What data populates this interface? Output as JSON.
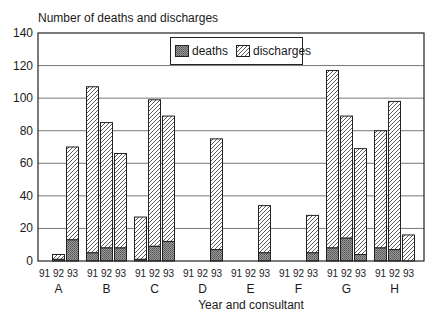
{
  "chart_data": {
    "type": "bar",
    "stacked": true,
    "title": "Number of deaths and discharges",
    "xlabel": "Year and consultant",
    "ylabel": "Number of deaths and discharges",
    "ylim": [
      0,
      140
    ],
    "yticks": [
      0,
      20,
      40,
      60,
      80,
      100,
      120,
      140
    ],
    "grid": true,
    "legend_position": "top-center",
    "groups": [
      "A",
      "B",
      "C",
      "D",
      "E",
      "F",
      "G",
      "H"
    ],
    "years": [
      "91",
      "92",
      "93"
    ],
    "categories": [
      "A-91",
      "A-92",
      "A-93",
      "B-91",
      "B-92",
      "B-93",
      "C-91",
      "C-92",
      "C-93",
      "D-91",
      "D-92",
      "D-93",
      "E-91",
      "E-92",
      "E-93",
      "F-91",
      "F-92",
      "F-93",
      "G-91",
      "G-92",
      "G-93",
      "H-91",
      "H-92",
      "H-93"
    ],
    "series": [
      {
        "name": "deaths",
        "pattern": "crosshatch",
        "values": [
          0,
          1,
          13,
          5,
          8,
          8,
          1,
          9,
          12,
          0,
          0,
          7,
          0,
          0,
          5,
          0,
          0,
          5,
          8,
          14,
          4,
          8,
          7,
          0
        ]
      },
      {
        "name": "discharges",
        "pattern": "diagonal",
        "values": [
          0,
          3,
          57,
          102,
          77,
          58,
          26,
          90,
          77,
          0,
          0,
          68,
          0,
          0,
          29,
          0,
          0,
          23,
          109,
          75,
          65,
          72,
          91,
          16
        ]
      }
    ],
    "totals": [
      0,
      4,
      70,
      107,
      85,
      66,
      27,
      99,
      89,
      0,
      0,
      75,
      0,
      0,
      34,
      0,
      0,
      28,
      117,
      89,
      69,
      80,
      98,
      16
    ]
  },
  "legend": {
    "deaths_label": "deaths",
    "discharges_label": "discharges"
  }
}
